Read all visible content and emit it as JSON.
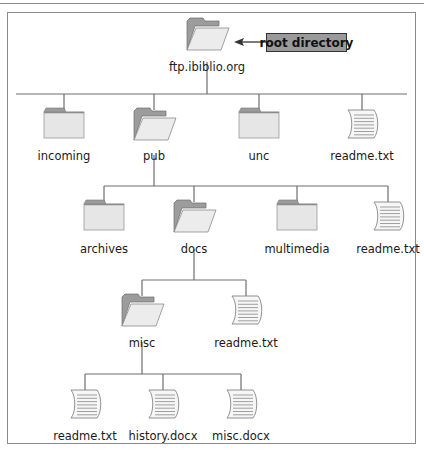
{
  "diagram": {
    "callout": {
      "label": "root directory",
      "points_to": "ftp.ibiblio.org"
    },
    "colors": {
      "line": "#6e6e6e",
      "folder_back": "#9c9c9c",
      "folder_front": "#ececec",
      "folder_closed": "#e6e6e6",
      "file_fill": "#f6f6f6",
      "file_line": "#7a7a7a",
      "callout_fill": "#9a9a9a",
      "border": "#8a8a8a"
    },
    "nodes": [
      {
        "id": "root",
        "label": "ftp.ibiblio.org",
        "type": "folder-open",
        "x": 207,
        "y": 18,
        "label_y": 71
      },
      {
        "id": "incoming",
        "label": "incoming",
        "type": "folder-closed",
        "x": 64,
        "y": 108,
        "label_y": 160,
        "parent": "root"
      },
      {
        "id": "pub",
        "label": "pub",
        "type": "folder-open",
        "x": 154,
        "y": 108,
        "label_y": 160,
        "parent": "root"
      },
      {
        "id": "unc",
        "label": "unc",
        "type": "folder-closed",
        "x": 259,
        "y": 108,
        "label_y": 160,
        "parent": "root"
      },
      {
        "id": "readme1",
        "label": "readme.txt",
        "type": "file",
        "x": 362,
        "y": 108,
        "label_y": 160,
        "parent": "root"
      },
      {
        "id": "archives",
        "label": "archives",
        "type": "folder-closed",
        "x": 104,
        "y": 200,
        "label_y": 253,
        "parent": "pub"
      },
      {
        "id": "docs",
        "label": "docs",
        "type": "folder-open",
        "x": 194,
        "y": 200,
        "label_y": 253,
        "parent": "pub"
      },
      {
        "id": "multimedia",
        "label": "multimedia",
        "type": "folder-closed",
        "x": 297,
        "y": 200,
        "label_y": 253,
        "parent": "pub"
      },
      {
        "id": "readme2",
        "label": "readme.txt",
        "type": "file",
        "x": 388,
        "y": 200,
        "label_y": 253,
        "parent": "pub"
      },
      {
        "id": "misc",
        "label": "misc",
        "type": "folder-open",
        "x": 142,
        "y": 294,
        "label_y": 347,
        "parent": "docs"
      },
      {
        "id": "readme3",
        "label": "readme.txt",
        "type": "file",
        "x": 246,
        "y": 294,
        "label_y": 347,
        "parent": "docs"
      },
      {
        "id": "readme4",
        "label": "readme.txt",
        "type": "file",
        "x": 85,
        "y": 388,
        "label_y": 440,
        "parent": "misc"
      },
      {
        "id": "history",
        "label": "history.docx",
        "type": "file",
        "x": 163,
        "y": 388,
        "label_y": 440,
        "parent": "misc"
      },
      {
        "id": "miscdocx",
        "label": "misc.docx",
        "type": "file",
        "x": 241,
        "y": 388,
        "label_y": 440,
        "parent": "misc"
      }
    ],
    "connectors": [
      {
        "parent": "root",
        "stem_from": 62,
        "bar_y": 94,
        "bar_x1": 16,
        "bar_x2": 407,
        "children": [
          "incoming",
          "pub",
          "unc",
          "readme1"
        ]
      },
      {
        "parent": "pub",
        "stem_from": 155,
        "bar_y": 186,
        "bar_x1": 104,
        "bar_x2": 388,
        "children": [
          "archives",
          "docs",
          "multimedia",
          "readme2"
        ]
      },
      {
        "parent": "docs",
        "stem_from": 249,
        "bar_y": 280,
        "bar_x1": 142,
        "bar_x2": 246,
        "children": [
          "misc",
          "readme3"
        ]
      },
      {
        "parent": "misc",
        "stem_from": 342,
        "bar_y": 374,
        "bar_x1": 85,
        "bar_x2": 241,
        "children": [
          "readme4",
          "history",
          "miscdocx"
        ]
      }
    ]
  }
}
